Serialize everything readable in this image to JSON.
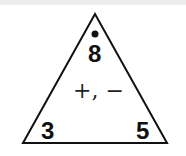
{
  "diagram": {
    "type": "fact-family-triangle",
    "top_number": "8",
    "top_marker": "dot",
    "operations": "+, −",
    "bottom_left_number": "3",
    "bottom_right_number": "5",
    "colors": {
      "stroke": "#111111",
      "text": "#111111",
      "background": "#ffffff"
    }
  }
}
